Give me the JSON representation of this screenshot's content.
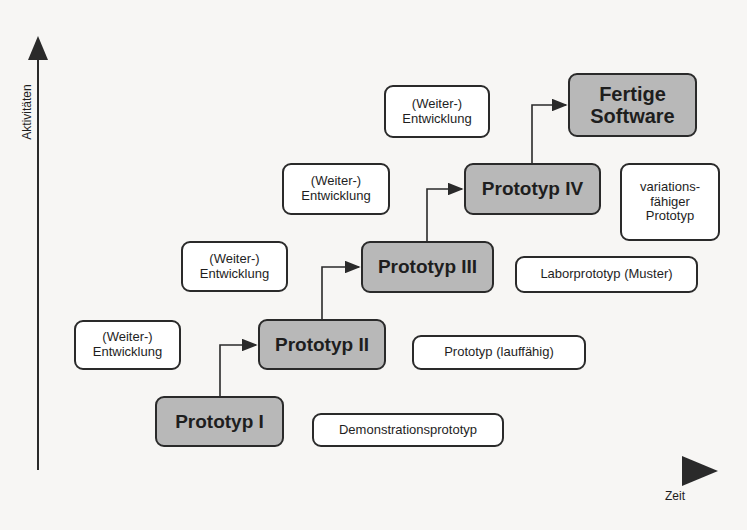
{
  "axes": {
    "y_label": "Aktivitäten",
    "x_label": "Zeit"
  },
  "prototypes": [
    {
      "id": "p1",
      "label": "Prototyp I"
    },
    {
      "id": "p2",
      "label": "Prototyp II"
    },
    {
      "id": "p3",
      "label": "Prototyp III"
    },
    {
      "id": "p4",
      "label": "Prototyp IV"
    },
    {
      "id": "final",
      "line1": "Fertige",
      "line2": "Software"
    }
  ],
  "development_boxes": [
    {
      "line1": "(Weiter-)",
      "line2": "Entwicklung"
    },
    {
      "line1": "(Weiter-)",
      "line2": "Entwicklung"
    },
    {
      "line1": "(Weiter-)",
      "line2": "Entwicklung"
    },
    {
      "line1": "(Weiter-)",
      "line2": "Entwicklung"
    }
  ],
  "type_labels": [
    {
      "label": "Demonstrationsprototyp"
    },
    {
      "label": "Prototyp (lauffähig)"
    },
    {
      "label": "Laborprototyp (Muster)"
    },
    {
      "line1": "variations-",
      "line2": "fähiger",
      "line3": "Prototyp"
    }
  ],
  "colors": {
    "prototype_fill": "#b8b8b8",
    "label_fill": "#ffffff",
    "stroke": "#2a2a2a",
    "background": "#f7f6f4"
  }
}
